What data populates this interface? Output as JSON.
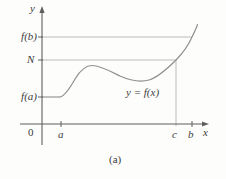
{
  "figure": {
    "caption": "(a)",
    "curve_label": "y = f(x)",
    "y_axis_label": "y",
    "x_axis_label": "x",
    "origin_label": "0",
    "y_axis_values": {
      "fb": "f(b)",
      "N": "N",
      "fa": "f(a)"
    },
    "x_axis_values": {
      "a": "a",
      "c": "c",
      "b": "b"
    }
  },
  "colors": {
    "background": "#fdfdfb",
    "axis": "#5f5f5f",
    "reference_line": "#b3b3b3",
    "curve": "#8f8f8f",
    "label": "#3c3c3c"
  }
}
